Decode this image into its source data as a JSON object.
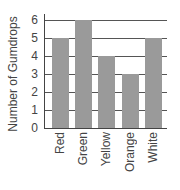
{
  "chart_data": {
    "type": "bar",
    "title": "",
    "xlabel": "",
    "ylabel": "Number of Gumdrops",
    "categories": [
      "Red",
      "Green",
      "Yellow",
      "Orange",
      "White"
    ],
    "values": [
      5,
      6,
      4,
      3,
      5
    ],
    "ylim": [
      0,
      6
    ],
    "yticks": [
      "0",
      "1",
      "2",
      "3",
      "4",
      "5",
      "6"
    ],
    "grid": true,
    "legend": null,
    "bar_color": "#9a9a9a"
  }
}
